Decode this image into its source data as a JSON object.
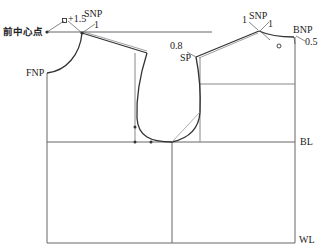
{
  "diagram": {
    "type": "garment bodice pattern draft (front and back)",
    "colors": {
      "line": "#555555",
      "curve": "#333333",
      "guide": "#777777",
      "text": "#222222",
      "background": "#ffffff"
    },
    "labels": {
      "front_center_point": "前中心点",
      "fnp": "FNP",
      "snp_front": "SNP",
      "snp_front_offset": "1",
      "front_neck_ease": "+1.5",
      "snp_back": "SNP",
      "snp_back_left_offset": "1",
      "snp_back_right_offset": "1",
      "bnp": "BNP",
      "bnp_offset": "0.5",
      "sp": "SP",
      "sp_offset": "0.8",
      "bl": "BL",
      "wl": "WL"
    }
  }
}
